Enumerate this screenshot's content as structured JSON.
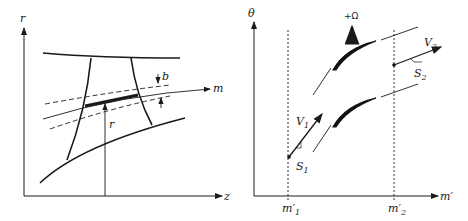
{
  "figure": {
    "left_panel": {
      "name": "meridional-plane",
      "axis_labels": {
        "vertical": "r",
        "horizontal": "z"
      },
      "annotations": {
        "streamline": "m",
        "stream_tube_thickness": "b",
        "radius": "r"
      }
    },
    "right_panel": {
      "name": "blade-to-blade-plane",
      "axis_labels": {
        "vertical": "θ",
        "horizontal": "m′"
      },
      "stations": [
        {
          "label": "m′",
          "sub": "1"
        },
        {
          "label": "m′",
          "sub": "2"
        }
      ],
      "rotation_label": "+Ω",
      "velocities": [
        {
          "label": "V",
          "sub": "1"
        },
        {
          "label": "V",
          "sub": "2"
        }
      ],
      "points": [
        {
          "label": "S",
          "sub": "1"
        },
        {
          "label": "S",
          "sub": "2"
        }
      ]
    },
    "colors": {
      "line": "#1a1a1a",
      "background": "#ffffff"
    }
  }
}
